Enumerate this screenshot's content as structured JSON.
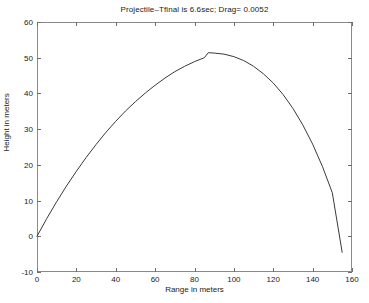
{
  "chart_data": {
    "type": "line",
    "title": "Projectile–Tfinal is 6.6sec; Drag= 0.0052",
    "xlabel": "Range in meters",
    "ylabel": "Height in meters",
    "xlim": [
      0,
      160
    ],
    "ylim": [
      -10,
      60
    ],
    "xticks": [
      0,
      20,
      40,
      60,
      80,
      100,
      120,
      140,
      160
    ],
    "yticks": [
      -10,
      0,
      10,
      20,
      30,
      40,
      50,
      60
    ],
    "xtick_labels": [
      "0",
      "20",
      "40",
      "60",
      "80",
      "100",
      "120",
      "140",
      "160"
    ],
    "ytick_labels": [
      "-10",
      "0",
      "10",
      "20",
      "30",
      "40",
      "50",
      "60"
    ],
    "grid": false,
    "legend": null,
    "line_color": "#3a3a3a",
    "series": [
      {
        "name": "trajectory",
        "x": [
          0,
          5,
          10,
          15,
          20,
          25,
          30,
          35,
          40,
          45,
          50,
          55,
          60,
          65,
          70,
          75,
          80,
          85,
          87,
          90,
          95,
          100,
          105,
          110,
          115,
          120,
          125,
          130,
          135,
          140,
          145,
          150,
          155
        ],
        "y": [
          0,
          5.0,
          9.7,
          14.1,
          18.2,
          22.1,
          25.7,
          29.1,
          32.2,
          35.1,
          37.7,
          40.1,
          42.3,
          44.3,
          46.1,
          47.6,
          48.9,
          50.0,
          51.4,
          51.3,
          51.0,
          50.3,
          49.2,
          47.6,
          45.5,
          42.9,
          39.7,
          35.8,
          31.2,
          25.8,
          19.5,
          12.2,
          -4.5
        ]
      }
    ],
    "annotations": {
      "peak_range": 87,
      "peak_height": 51.5,
      "final_range": 155,
      "final_height": -4.5,
      "tfinal_sec": 6.6,
      "drag": 0.0052
    }
  }
}
